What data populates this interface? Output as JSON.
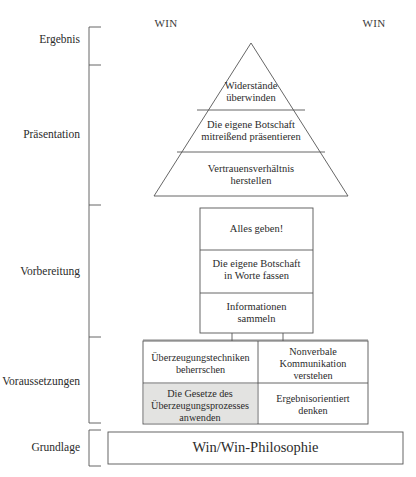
{
  "diagram": {
    "title_clipped": "",
    "win_left": "WIN",
    "win_right": "WIN",
    "stages": [
      {
        "label": "Ergebnis"
      },
      {
        "label": "Präsentation"
      },
      {
        "label": "Vorbereitung"
      },
      {
        "label": "Voraussetzungen"
      },
      {
        "label": "Grundlage"
      }
    ],
    "pyramid_tiers": [
      {
        "text": "Widerstände\nüberwinden"
      },
      {
        "text": "Die eigene Botschaft\nmitreißend präsentieren"
      },
      {
        "text": "Vertrauensverhältnis\nherstellen"
      }
    ],
    "preparation_boxes": [
      {
        "text": "Alles geben!"
      },
      {
        "text": "Die eigene Botschaft\nin Worte fassen"
      },
      {
        "text": "Informationen\nsammeln"
      }
    ],
    "prerequisite_cells": [
      {
        "text": "Überzeugungstechniken\nbeherrschen",
        "shaded": false
      },
      {
        "text": "Nonverbale\nKommunikation\nverstehen",
        "shaded": false
      },
      {
        "text": "Die Gesetze des\nÜberzeugungsprozesses\nanwenden",
        "shaded": true
      },
      {
        "text": "Ergebnisorientiert\ndenken",
        "shaded": false
      }
    ],
    "foundation": {
      "text": "Win/Win-Philosophie"
    },
    "colors": {
      "stroke": "#555555",
      "shaded_fill": "#e3e3e1",
      "background": "#ffffff",
      "text": "#2b2b2b"
    }
  }
}
